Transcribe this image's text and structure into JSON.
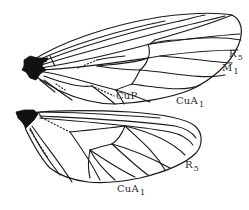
{
  "figure": {
    "forewing": {
      "labels": {
        "r5": {
          "main": "R",
          "sub": "5"
        },
        "m1": {
          "main": "M",
          "sub": "1"
        },
        "cup": {
          "main": "CuP",
          "sub": ""
        },
        "cua1": {
          "main": "CuA",
          "sub": "1"
        }
      }
    },
    "hindwing": {
      "labels": {
        "r5": {
          "main": "R",
          "sub": "5"
        },
        "cua1": {
          "main": "CuA",
          "sub": "1"
        }
      }
    },
    "colors": {
      "line": "#1a1a1a",
      "background": "#ffffff",
      "label_text": "#2a2a2a"
    }
  }
}
